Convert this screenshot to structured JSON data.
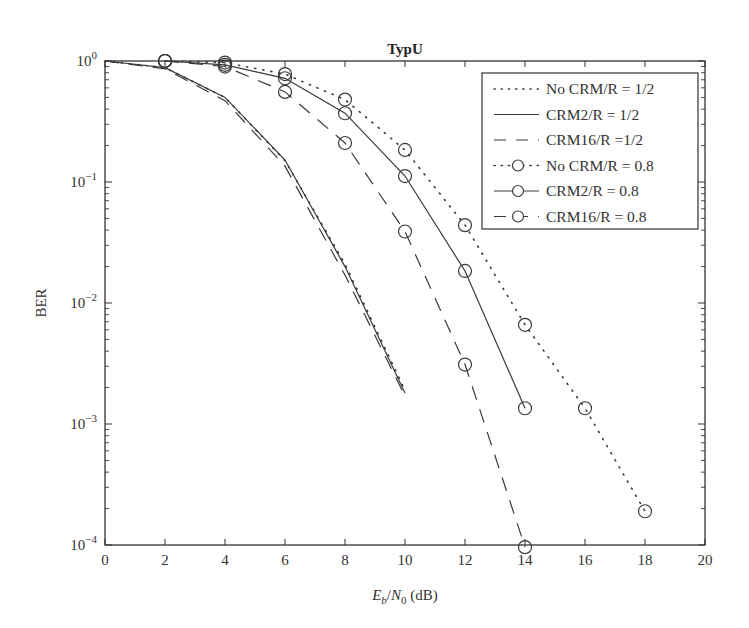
{
  "chart_data": {
    "type": "line",
    "title": "TypU",
    "xlabel": "E_b/N_0 (dB)",
    "xlabel_parts": {
      "E": "E",
      "b": "b",
      "slash": "/",
      "N": "N",
      "zero": "0",
      "unit": " (dB)"
    },
    "ylabel": "BER",
    "xlim": [
      0,
      20
    ],
    "ylim": [
      0.0001,
      1
    ],
    "yscale": "log",
    "xticks": [
      0,
      2,
      4,
      6,
      8,
      10,
      12,
      14,
      16,
      18,
      20
    ],
    "yticks": [
      {
        "value": 1,
        "base": "10",
        "exp": "0"
      },
      {
        "value": 0.1,
        "base": "10",
        "exp": "−1"
      },
      {
        "value": 0.01,
        "base": "10",
        "exp": "−2"
      },
      {
        "value": 0.001,
        "base": "10",
        "exp": "−3"
      },
      {
        "value": 0.0001,
        "base": "10",
        "exp": "−4"
      }
    ],
    "grid": false,
    "legend_position": "upper right",
    "series": [
      {
        "name": "No CRM/R = 1/2",
        "style": "dotted",
        "marker": "none",
        "x": [
          0,
          2,
          4,
          6,
          8,
          10
        ],
        "values": [
          1.0,
          0.88,
          0.5,
          0.15,
          0.021,
          0.0019
        ]
      },
      {
        "name": "CRM2/R = 1/2",
        "style": "solid",
        "marker": "none",
        "x": [
          0,
          2,
          4,
          6,
          8,
          10
        ],
        "values": [
          1.0,
          0.88,
          0.5,
          0.152,
          0.02,
          0.0018
        ]
      },
      {
        "name": "CRM16/R =1/2",
        "style": "dashed",
        "marker": "none",
        "x": [
          0,
          2,
          4,
          6,
          8,
          10
        ],
        "values": [
          1.0,
          0.86,
          0.47,
          0.135,
          0.017,
          0.0017
        ]
      },
      {
        "name": "No CRM/R = 0.8",
        "style": "dotted",
        "marker": "circle",
        "x": [
          2,
          4,
          6,
          8,
          10,
          12,
          14,
          16,
          18
        ],
        "values": [
          1.0,
          0.97,
          0.78,
          0.48,
          0.184,
          0.044,
          0.0066,
          0.00135,
          0.00019
        ]
      },
      {
        "name": "CRM2/R = 0.8",
        "style": "solid",
        "marker": "circle",
        "x": [
          2,
          4,
          6,
          8,
          10,
          12,
          14
        ],
        "values": [
          1.0,
          0.93,
          0.72,
          0.37,
          0.112,
          0.0184,
          0.00135
        ]
      },
      {
        "name": "CRM16/R = 0.8",
        "style": "dashed",
        "marker": "circle",
        "x": [
          2,
          4,
          6,
          8,
          10,
          12,
          14
        ],
        "values": [
          1.0,
          0.9,
          0.555,
          0.21,
          0.039,
          0.0031,
          9.6e-05
        ]
      }
    ]
  },
  "colors": {
    "line": "#3a3a3a",
    "axis": "#333333",
    "background": "#ffffff"
  }
}
